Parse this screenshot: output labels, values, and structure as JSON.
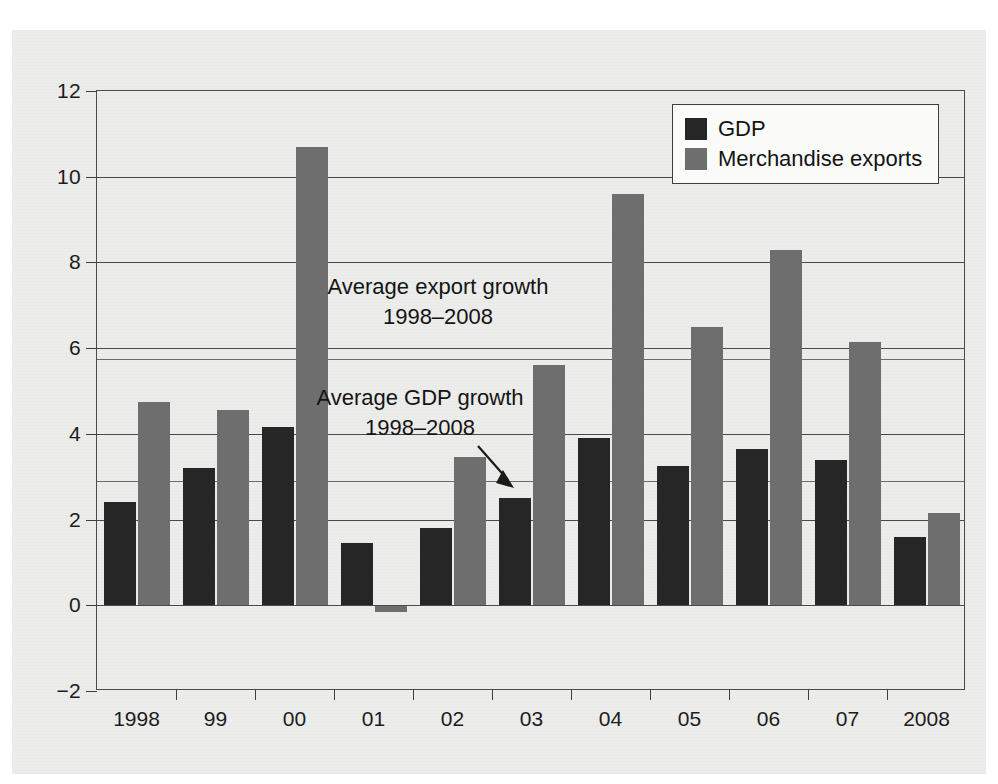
{
  "chart_data": {
    "type": "bar",
    "title": "",
    "subtitle": "",
    "xlabel": "",
    "ylabel": "",
    "categories": [
      "1998",
      "99",
      "00",
      "01",
      "02",
      "03",
      "04",
      "05",
      "06",
      "07",
      "2008"
    ],
    "series": [
      {
        "name": "GDP",
        "color": "#262626",
        "values": [
          2.4,
          3.2,
          4.15,
          1.45,
          1.8,
          2.5,
          3.9,
          3.25,
          3.65,
          3.4,
          1.6
        ]
      },
      {
        "name": "Merchandise exports",
        "color": "#6e6e6e",
        "values": [
          4.75,
          4.55,
          10.7,
          -0.15,
          3.45,
          5.6,
          9.6,
          6.5,
          8.3,
          6.15,
          2.15
        ]
      }
    ],
    "ylim": [
      -2,
      12
    ],
    "yticks": [
      -2,
      0,
      2,
      4,
      6,
      8,
      10,
      12
    ],
    "ytick_labels": [
      "−2",
      "0",
      "2",
      "4",
      "6",
      "8",
      "10",
      "12"
    ],
    "grid": "horizontal",
    "legend_position": "top-right",
    "reference_lines": [
      {
        "name": "average-export-growth",
        "value": 5.75,
        "label_line1": "Average export growth",
        "label_line2": "1998–2008"
      },
      {
        "name": "average-gdp-growth",
        "value": 2.9,
        "label_line1": "Average GDP growth",
        "label_line2": "1998–2008"
      }
    ],
    "annotations": [
      {
        "name": "average-export-growth-annotation",
        "line1": "Average export growth",
        "line2": "1998–2008"
      },
      {
        "name": "average-gdp-growth-annotation",
        "line1": "Average GDP growth",
        "line2": "1998–2008"
      }
    ]
  },
  "legend": {
    "items": [
      {
        "label": "GDP",
        "color": "#262626"
      },
      {
        "label": "Merchandise exports",
        "color": "#6e6e6e"
      }
    ]
  },
  "axes": {
    "y_tick_labels": [
      "12",
      "10",
      "8",
      "6",
      "4",
      "2",
      "0",
      "−2"
    ],
    "x_tick_labels": [
      "1998",
      "99",
      "00",
      "01",
      "02",
      "03",
      "04",
      "05",
      "06",
      "07",
      "2008"
    ]
  }
}
